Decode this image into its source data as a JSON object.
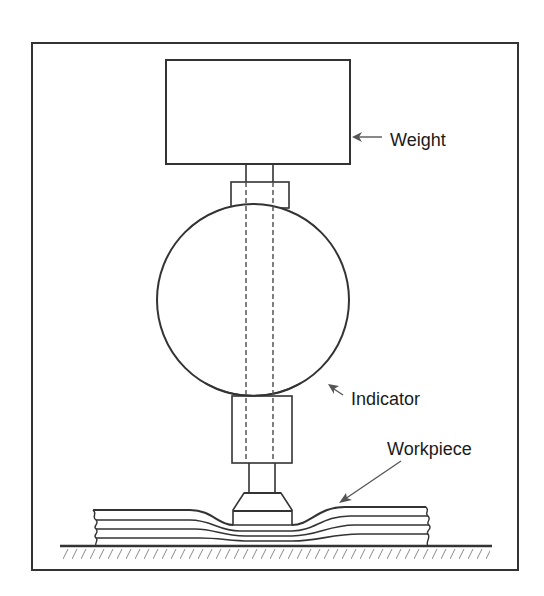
{
  "diagram": {
    "type": "mechanical-schematic",
    "colors": {
      "line": "#333333",
      "text": "#1a1a1a",
      "hatch": "#8a8a8a",
      "background": "#ffffff"
    },
    "labels": {
      "weight": "Weight",
      "indicator": "Indicator",
      "workpiece": "Workpiece"
    },
    "components": [
      {
        "id": "weight",
        "label": "Weight"
      },
      {
        "id": "upper-collar",
        "label": ""
      },
      {
        "id": "indicator",
        "label": "Indicator"
      },
      {
        "id": "spindle",
        "label": ""
      },
      {
        "id": "lower-sleeve",
        "label": ""
      },
      {
        "id": "contact-foot",
        "label": ""
      },
      {
        "id": "workpiece",
        "label": "Workpiece"
      },
      {
        "id": "base-surface",
        "label": ""
      }
    ]
  }
}
